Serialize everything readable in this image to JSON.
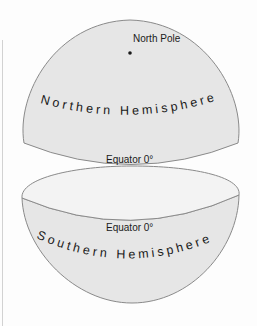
{
  "diagram": {
    "colors": {
      "background": "#fdfdfd",
      "surface": "#e6e6e6",
      "cap": "#f3f3f3",
      "outline": "#8a8a8a",
      "text": "#1a1a1a"
    },
    "northern": {
      "label": "Northern Hemisphere",
      "pole_label": "North Pole",
      "equator_label": "Equator 0°"
    },
    "southern": {
      "label": "Southern Hemisphere",
      "equator_label": "Equator 0°"
    }
  }
}
